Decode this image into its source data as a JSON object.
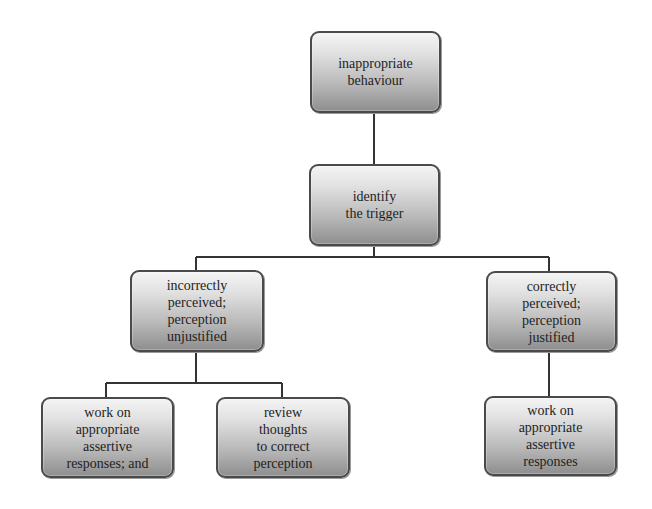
{
  "diagram": {
    "type": "flowchart-tree",
    "nodes": {
      "root": {
        "lines": [
          "inappropriate",
          "behaviour"
        ]
      },
      "identify": {
        "lines": [
          "identify",
          "the trigger"
        ]
      },
      "incorrect": {
        "lines": [
          "incorrectly",
          "perceived;",
          "perception",
          "unjustified"
        ]
      },
      "correct": {
        "lines": [
          "correctly",
          "perceived;",
          "perception",
          "justified"
        ]
      },
      "work_assertive_and": {
        "lines": [
          "work on",
          "appropriate",
          "assertive",
          "responses; and"
        ]
      },
      "review_thoughts": {
        "lines": [
          "review",
          "thoughts",
          "to correct",
          "perception"
        ]
      },
      "work_assertive": {
        "lines": [
          "work on",
          "appropriate",
          "assertive",
          "responses"
        ]
      }
    },
    "edges": [
      {
        "from": "root",
        "to": "identify"
      },
      {
        "from": "identify",
        "to": "incorrect"
      },
      {
        "from": "identify",
        "to": "correct"
      },
      {
        "from": "incorrect",
        "to": "work_assertive_and"
      },
      {
        "from": "incorrect",
        "to": "review_thoughts"
      },
      {
        "from": "correct",
        "to": "work_assertive"
      }
    ],
    "colors": {
      "line": "#333333",
      "box_border": "#4a4a4a",
      "box_top": "#f4f4f4",
      "box_bottom": "#8e8e8e",
      "text": "#1e1e1e"
    }
  }
}
